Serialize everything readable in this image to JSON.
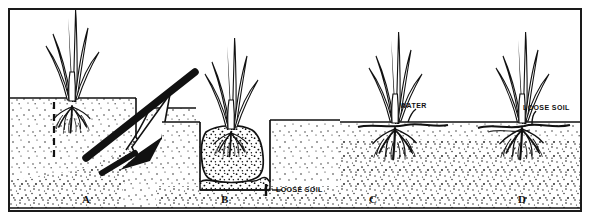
{
  "figure": {
    "background_color": "#ffffff",
    "ink_color": "#111111",
    "frame": {
      "border_color": "#1a1a1a",
      "border_width_px": 2
    }
  },
  "panels": [
    {
      "letter": "A",
      "name": "digging-hole",
      "caption": "",
      "callouts": []
    },
    {
      "letter": "B",
      "name": "setting-plant-in-hole",
      "caption": "",
      "callouts": [
        {
          "text": "LOOSE SOIL",
          "name": "loose-soil-callout-b"
        }
      ]
    },
    {
      "letter": "C",
      "name": "watering-plant",
      "caption": "",
      "callouts": [
        {
          "text": "WATER",
          "name": "water-callout-c"
        }
      ]
    },
    {
      "letter": "D",
      "name": "backfilling-loose-soil",
      "caption": "",
      "callouts": [
        {
          "text": "LOOSE SOIL",
          "name": "loose-soil-callout-d"
        }
      ]
    }
  ],
  "labels": {
    "loose_soil_b": "LOOSE SOIL",
    "water_c": "WATER",
    "loose_soil_d": "LOOSE SOIL",
    "letter_a": "A",
    "letter_b": "B",
    "letter_c": "C",
    "letter_d": "D"
  }
}
